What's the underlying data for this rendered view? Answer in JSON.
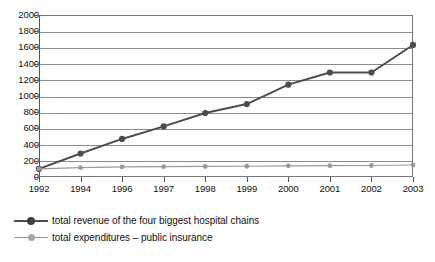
{
  "chart_data": {
    "type": "line",
    "title": "",
    "xlabel": "",
    "ylabel": "",
    "categories": [
      "1992",
      "1994",
      "1996",
      "1997",
      "1998",
      "1999",
      "2000",
      "2001",
      "2002",
      "2003"
    ],
    "ylim": [
      0,
      2000
    ],
    "ytick_values": [
      0,
      200,
      400,
      600,
      800,
      1000,
      1200,
      1400,
      1600,
      1800,
      2000
    ],
    "ytick_labels": [
      "0",
      "200",
      "400",
      "600",
      "800",
      "1000",
      "1200",
      "1400",
      "1600",
      "1800",
      "2000"
    ],
    "grid": true,
    "legend_position": "below-left",
    "series": [
      {
        "name": "total revenue of the four biggest hospital chains",
        "color": "#4d4d4d",
        "marker": "circle",
        "values": [
          100,
          290,
          470,
          625,
          790,
          900,
          1140,
          1290,
          1290,
          1630
        ]
      },
      {
        "name": "total expenditures – public insurance",
        "color": "#9a9a9a",
        "marker": "circle",
        "values": [
          100,
          115,
          125,
          128,
          130,
          133,
          138,
          140,
          142,
          148
        ]
      }
    ]
  },
  "legend": {
    "items": [
      {
        "label": "total revenue of the four biggest hospital chains"
      },
      {
        "label": "total expenditures – public insurance"
      }
    ]
  }
}
